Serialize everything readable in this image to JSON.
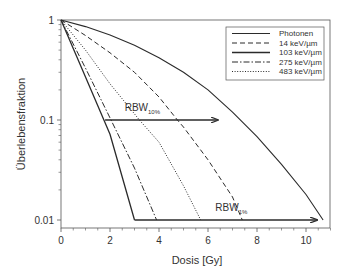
{
  "chart_data": {
    "type": "line",
    "title": "",
    "xlabel": "Dosis [Gy]",
    "ylabel": "Überlebensfraktion",
    "xlim": [
      0,
      11
    ],
    "ylim": [
      0.01,
      1
    ],
    "yscale": "log",
    "x_ticks": [
      0,
      2,
      4,
      6,
      8,
      10
    ],
    "y_ticks": [
      {
        "value": 1,
        "label": "1"
      },
      {
        "value": 0.1,
        "label": "0.1"
      },
      {
        "value": 0.01,
        "label": "0.01"
      }
    ],
    "grid": false,
    "legend_position": "upper right",
    "series": [
      {
        "name": "Photonen",
        "style": "solid",
        "width": 1.1,
        "x": [
          0,
          1,
          2,
          3,
          4,
          5,
          6,
          7,
          8,
          9,
          10,
          10.7
        ],
        "y": [
          1,
          0.86,
          0.71,
          0.56,
          0.42,
          0.3,
          0.2,
          0.12,
          0.068,
          0.036,
          0.018,
          0.01
        ]
      },
      {
        "name": "14 keV/µm",
        "style": "dashed",
        "width": 1.0,
        "x": [
          0,
          1,
          2,
          3,
          4,
          4.75,
          5,
          6,
          7,
          7.4
        ],
        "y": [
          1,
          0.7,
          0.47,
          0.3,
          0.17,
          0.1,
          0.085,
          0.04,
          0.017,
          0.01
        ]
      },
      {
        "name": "103 keV/µm",
        "style": "solid",
        "width": 1.3,
        "x": [
          0,
          1,
          1.75,
          2,
          3.0
        ],
        "y": [
          1,
          0.27,
          0.1,
          0.072,
          0.01
        ]
      },
      {
        "name": "275 keV/µm",
        "style": "dashdot",
        "width": 1.0,
        "x": [
          0,
          1,
          2,
          3,
          3.9
        ],
        "y": [
          1,
          0.33,
          0.105,
          0.033,
          0.01
        ]
      },
      {
        "name": "483 keV/µm",
        "style": "dotted",
        "width": 1.0,
        "x": [
          0,
          1,
          2,
          3,
          3.2,
          4,
          5,
          5.7
        ],
        "y": [
          1,
          0.5,
          0.23,
          0.115,
          0.1,
          0.06,
          0.022,
          0.01
        ]
      }
    ],
    "annotations": [
      {
        "text": "RBW",
        "subscript": "10%",
        "arrow_from": [
          1.8,
          0.1
        ],
        "arrow_to": [
          6.4,
          0.1
        ],
        "label_at": [
          2.6,
          0.115
        ]
      },
      {
        "text": "RBW",
        "subscript": "1%",
        "arrow_from": [
          3.0,
          0.01
        ],
        "arrow_to": [
          10.45,
          0.01
        ],
        "label_at": [
          6.3,
          0.0115
        ]
      }
    ]
  },
  "colors": {
    "line": "#2b2b2b",
    "axis": "#555555",
    "text": "#333333",
    "background": "#ffffff"
  }
}
